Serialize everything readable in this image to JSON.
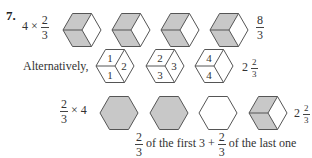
{
  "problem": {
    "number": "7.",
    "row1": {
      "expression": {
        "whole": "4",
        "op": "×",
        "num": "2",
        "den": "3"
      },
      "hexagons": [
        {
          "shaded": [
            "top-left",
            "bottom-left"
          ]
        },
        {
          "shaded": [
            "top-left",
            "bottom-left"
          ]
        },
        {
          "shaded": [
            "top-left",
            "bottom-left"
          ]
        },
        {
          "shaded": [
            "top-left",
            "bottom-left"
          ]
        }
      ],
      "result": {
        "num": "8",
        "den": "3"
      }
    },
    "row2": {
      "label": "Alternatively,",
      "hexagons": [
        {
          "labels": {
            "top-left": "1",
            "bottom-left": "1",
            "right": "2"
          }
        },
        {
          "labels": {
            "top-left": "2",
            "bottom-left": "3",
            "right": "3"
          }
        },
        {
          "labels": {
            "top-left": "4",
            "bottom-left": "4",
            "right": ""
          }
        }
      ],
      "result": {
        "whole": "2",
        "num": "2",
        "den": "3"
      }
    },
    "row3": {
      "expression": {
        "num": "2",
        "den": "3",
        "op": "× 4"
      },
      "hexagons": [
        {
          "shaded": "full"
        },
        {
          "shaded": "full"
        },
        {
          "shaded": "none"
        },
        {
          "shaded": [
            "top-left",
            "bottom-left"
          ]
        }
      ],
      "result": {
        "whole": "2",
        "num": "2",
        "den": "3"
      }
    },
    "caption": {
      "frac1": {
        "num": "2",
        "den": "3"
      },
      "middle": "of the first 3 +",
      "frac2": {
        "num": "2",
        "den": "3"
      },
      "end": "of the last one"
    }
  },
  "colors": {
    "shade": "#c8c8c8",
    "stroke": "#555555"
  }
}
